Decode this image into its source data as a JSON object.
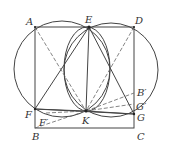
{
  "diagram": {
    "type": "geometry",
    "points": {
      "A": {
        "label": "A",
        "x": 35,
        "y": 27
      },
      "E": {
        "label": "E",
        "x": 89,
        "y": 27
      },
      "D": {
        "label": "D",
        "x": 134,
        "y": 27
      },
      "F": {
        "label": "F",
        "x": 35,
        "y": 109
      },
      "K": {
        "label": "K",
        "x": 86,
        "y": 111
      },
      "G": {
        "label": "G",
        "x": 134,
        "y": 114
      },
      "B": {
        "label": "B",
        "x": 35,
        "y": 128
      },
      "C": {
        "label": "C",
        "x": 134,
        "y": 128
      },
      "F_prime": {
        "label": "F′",
        "x": 46,
        "y": 113
      },
      "G_prime": {
        "label": "G′",
        "x": 134,
        "y": 104
      },
      "B_prime": {
        "label": "B′",
        "x": 134,
        "y": 93
      }
    },
    "labels": {
      "A": "A",
      "E": "E",
      "D": "D",
      "F": "F",
      "K": "K",
      "G": "G",
      "B": "B",
      "C": "C",
      "Fp": "F′",
      "Gp": "G′",
      "Bp": "B′"
    }
  }
}
